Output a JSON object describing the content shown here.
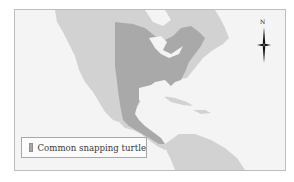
{
  "map": {
    "colors": {
      "ocean": "#f4f4f4",
      "land": "#d2d2d2",
      "range": "#a9a9a9",
      "frame": "#bdbdbd"
    },
    "compass": {
      "north_label": "N",
      "icon": "compass-rose-icon"
    },
    "legend": {
      "items": [
        {
          "label": "Common snapping turtle",
          "color": "#a9a9a9"
        }
      ]
    }
  }
}
